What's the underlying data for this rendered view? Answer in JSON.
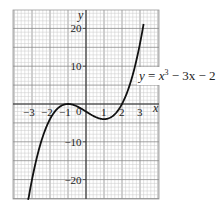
{
  "chart_data": {
    "type": "line",
    "title": "",
    "xlabel": "x",
    "ylabel": "y",
    "xlim": [
      -4,
      4.1
    ],
    "ylim": [
      -25,
      25
    ],
    "grid": true,
    "x_ticks": [
      -3,
      -2,
      -1,
      1,
      2,
      3
    ],
    "x_tick_labels": [
      "−3",
      "−2",
      "−1",
      "1",
      "2",
      "3"
    ],
    "y_ticks": [
      20,
      10,
      -10,
      -20
    ],
    "y_tick_labels": [
      "20",
      "10",
      "−10",
      "−20"
    ],
    "series": [
      {
        "name": "y = x³ − 3x − 2",
        "function": "x^3 - 3x - 2",
        "x_range": [
          -3.25,
          3.2
        ],
        "points": [
          [
            -3.25,
            -26.6
          ],
          [
            -3,
            -20
          ],
          [
            -2.5,
            -10.1
          ],
          [
            -2,
            -4
          ],
          [
            -1.5,
            -0.9
          ],
          [
            -1,
            0
          ],
          [
            -0.5,
            -0.6
          ],
          [
            0,
            -2
          ],
          [
            0.5,
            -3.4
          ],
          [
            1,
            -4
          ],
          [
            1.5,
            -2.1
          ],
          [
            2,
            0
          ],
          [
            2.5,
            6.1
          ],
          [
            3,
            16
          ],
          [
            3.2,
            19.2
          ]
        ]
      }
    ],
    "annotations": [
      {
        "text": "y = x³ − 3x − 2",
        "position": "right of curve, near y≈8"
      }
    ]
  },
  "labels": {
    "x_axis": "x",
    "y_axis": "y",
    "equation_lhs": "y",
    "equation_rhs_var": "x",
    "equation_exp": "3",
    "equation_rest": " − 3x − 2",
    "equation_eq": " = "
  }
}
